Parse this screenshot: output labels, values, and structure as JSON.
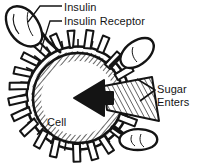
{
  "diagram": {
    "background_color": "#ffffff",
    "ink_color": "#141414",
    "labels": {
      "insulin": "Insulin",
      "insulin_receptor": "Insulin Receptor",
      "sugar_enters_line1": "Sugar",
      "sugar_enters_line2": "Enters",
      "cell": "Cell"
    },
    "parts": {
      "cell_body": "cell-body",
      "cell_membrane": "cell-membrane",
      "receptor_spikes": "receptor-spikes",
      "insulin_molecule_top_left": "insulin-molecule",
      "insulin_molecule_top_right": "insulin-molecule",
      "insulin_molecule_bottom_right": "insulin-molecule",
      "sugar_arrow": "sugar-arrow"
    },
    "leader_lines": {
      "insulin": "leader-line-insulin",
      "insulin_receptor": "leader-line-insulin-receptor",
      "sugar_enters": "leader-line-sugar-enters"
    }
  }
}
